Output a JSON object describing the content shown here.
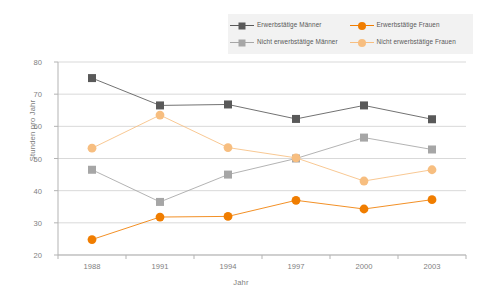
{
  "chart_data": {
    "type": "line",
    "title": "",
    "xlabel": "Jahr",
    "ylabel": "Stunden pro Jahr",
    "categories": [
      "1988",
      "1991",
      "1994",
      "1997",
      "2000",
      "2003"
    ],
    "x_ticks": [
      "1988",
      "1991",
      "1994",
      "1997",
      "2000",
      "2003"
    ],
    "y_ticks": [
      "20",
      "30",
      "40",
      "50",
      "60",
      "70",
      "80"
    ],
    "ylim": [
      20,
      80
    ],
    "grid": "horizontal",
    "legend_position": "top-right",
    "series": [
      {
        "name": "Erwerbstätige Männer",
        "color": "#595959",
        "marker": "square",
        "values": [
          75,
          66.5,
          66.8,
          62.3,
          66.5,
          62.2
        ]
      },
      {
        "name": "Nicht erwerbstätige Männer",
        "color": "#a6a6a6",
        "marker": "square",
        "values": [
          46.5,
          36.5,
          45,
          50,
          56.5,
          52.8
        ]
      },
      {
        "name": "Erwerbstätige Frauen",
        "color": "#f07d00",
        "marker": "circle",
        "values": [
          24.8,
          31.8,
          32,
          37,
          34.3,
          37.2
        ]
      },
      {
        "name": "Nicht erwerbstätige Frauen",
        "color": "#f7be80",
        "marker": "circle",
        "values": [
          53.2,
          63.5,
          53.4,
          50.2,
          43,
          46.5
        ]
      }
    ]
  },
  "legend": {
    "entries": [
      {
        "label": "Erwerbstätige Männer",
        "color": "#595959",
        "marker": "square"
      },
      {
        "label": "Erwerbstätige Frauen",
        "color": "#f07d00",
        "marker": "circle"
      },
      {
        "label": "Nicht erwerbstätige Männer",
        "color": "#a6a6a6",
        "marker": "square"
      },
      {
        "label": "Nicht erwerbstätige Frauen",
        "color": "#f7be80",
        "marker": "circle"
      }
    ]
  },
  "colors": {
    "employed_men": "#595959",
    "nonemployed_men": "#a6a6a6",
    "employed_women": "#f07d00",
    "nonemployed_women": "#f7be80",
    "grid": "#d9d9d9",
    "axis": "#b3b3b3",
    "text": "#808080",
    "legend_bg": "#f2f2f2",
    "background": "#ffffff"
  }
}
